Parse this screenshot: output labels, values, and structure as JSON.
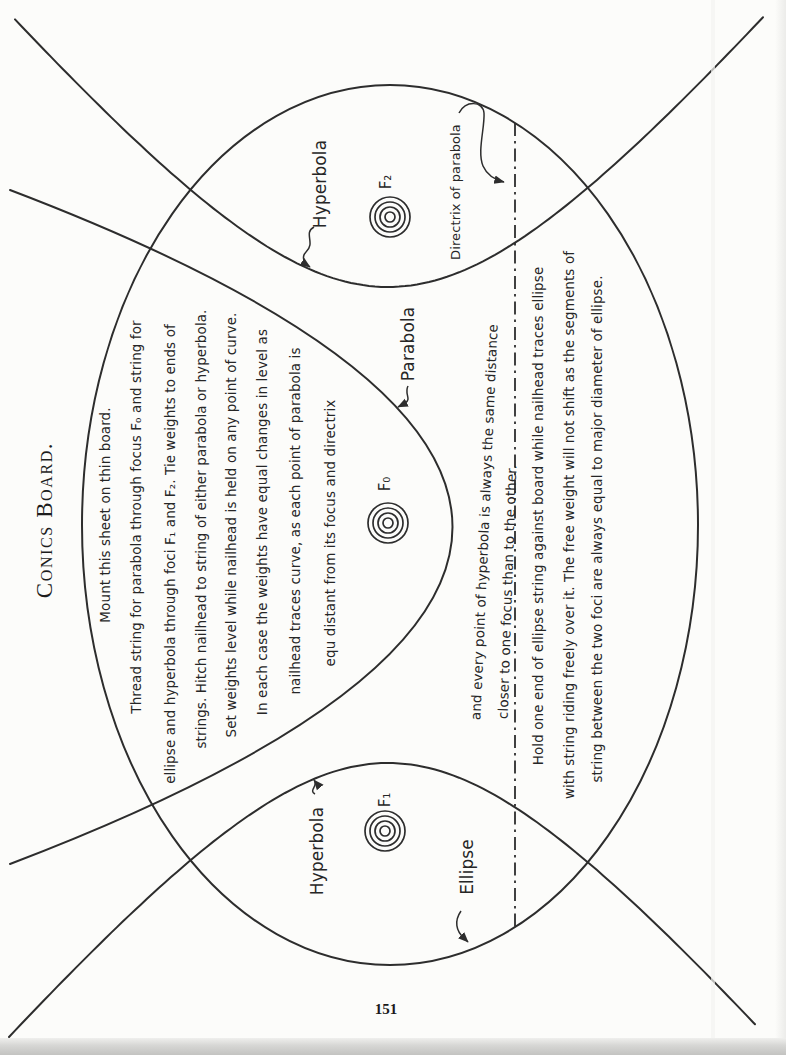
{
  "page": {
    "title": "Conics Board.",
    "page_number": "151"
  },
  "instructions": {
    "para1": [
      "Mount this sheet on thin board.",
      "Thread string for parabola through focus F₀ and string for",
      "ellipse and hyperbola through foci F₁ and F₂.  Tie weights to ends of",
      "strings. Hitch nailhead to string of either parabola or hyperbola.",
      "Set weights level while nailhead is held on any point of curve.",
      "In each case the weights have equal changes in level as",
      "nailhead traces curve, as each point of parabola is",
      "equ distant from its focus and directrix"
    ],
    "para2": [
      "and every point of hyperbola is always the same distance",
      "closer to one focus than to the other."
    ],
    "para3": [
      "Hold one end of ellipse string against board while nailhead traces ellipse",
      "with string riding freely over it. The free weight will not shift as the segments of",
      "string between the two foci are always equal to major diameter of ellipse."
    ]
  },
  "labels": {
    "hyperbola_top": "Hyperbola",
    "directrix": "Directrix of parabola",
    "parabola": "Parabola",
    "hyperbola_bottom": "Hyperbola",
    "ellipse": "Ellipse",
    "focus_f2": "F₂",
    "focus_f0": "F₀",
    "focus_f1": "F₁"
  },
  "colors": {
    "ink": "#2d2d2d",
    "paper": "#fcfcfa"
  }
}
